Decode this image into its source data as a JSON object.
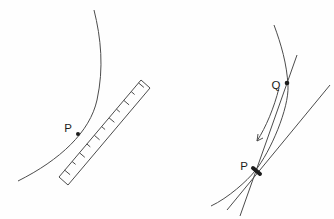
{
  "colors": {
    "line": "#4c4c4c",
    "label": "#1c1c1c",
    "background": "#fefefe"
  },
  "left_figure": {
    "point_p_label": "P"
  },
  "right_figure": {
    "point_p_label": "P",
    "point_q_label": "Q"
  }
}
